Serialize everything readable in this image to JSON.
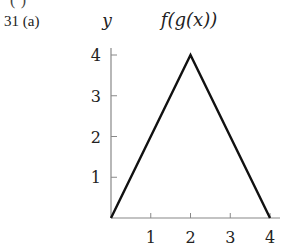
{
  "problem": {
    "label": "31 (a)",
    "cut_off_text": "(·)"
  },
  "chart_data": {
    "type": "line",
    "title": "f(g(x))",
    "xlabel": "",
    "ylabel": "y",
    "x": [
      0,
      2,
      4
    ],
    "series": [
      {
        "name": "f(g(x))",
        "values": [
          0,
          4,
          0
        ]
      }
    ],
    "xlim": [
      0,
      4.2
    ],
    "ylim": [
      0,
      4.1
    ],
    "x_ticks": [
      1,
      2,
      3,
      4
    ],
    "y_ticks": [
      1,
      2,
      3,
      4
    ],
    "grid": false,
    "legend": "none",
    "colors": {
      "line": "#111111",
      "axis": "#888888",
      "text": "#222222"
    }
  },
  "layout": {
    "origin_px": [
      111,
      218
    ],
    "px_per_x": 39.75,
    "px_per_y": 40.75,
    "x_axis_end_px": 280,
    "y_axis_top_px": 48
  }
}
